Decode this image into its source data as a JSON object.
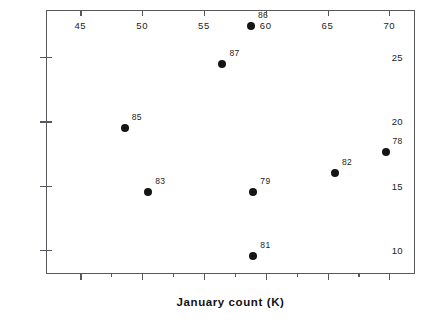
{
  "chart_data": {
    "type": "scatter",
    "title": "",
    "xlabel": "January count (K)",
    "ylabel": "Breeding pairs West Med. (K)",
    "xlim": [
      42.3,
      72.0
    ],
    "ylim": [
      8.2,
      28.6
    ],
    "grid": false,
    "legend": null,
    "x_major_ticks": [
      45,
      50,
      55,
      60,
      65,
      70
    ],
    "x_minor_ticks": [
      47.5,
      52.5,
      57.5,
      62.5,
      67.5
    ],
    "x_tick_labels": [
      "45",
      "50",
      "55",
      "60",
      "65",
      "70"
    ],
    "y_major_ticks": [
      10,
      15,
      20,
      25
    ],
    "y_tick_labels": [
      "10",
      "15",
      "20",
      "25"
    ],
    "points": [
      {
        "label": "78",
        "x": 69.7,
        "y": 17.6
      },
      {
        "label": "79",
        "x": 59.0,
        "y": 14.5
      },
      {
        "label": "81",
        "x": 59.0,
        "y": 9.5
      },
      {
        "label": "82",
        "x": 65.6,
        "y": 16.0
      },
      {
        "label": "83",
        "x": 50.5,
        "y": 14.5
      },
      {
        "label": "85",
        "x": 48.6,
        "y": 19.5
      },
      {
        "label": "86",
        "x": 58.8,
        "y": 27.4
      },
      {
        "label": "87",
        "x": 56.5,
        "y": 24.5
      }
    ],
    "colors": {
      "marker": "#151515",
      "axis": "#55595c",
      "text": "#121212",
      "background": "#ffffff"
    }
  }
}
